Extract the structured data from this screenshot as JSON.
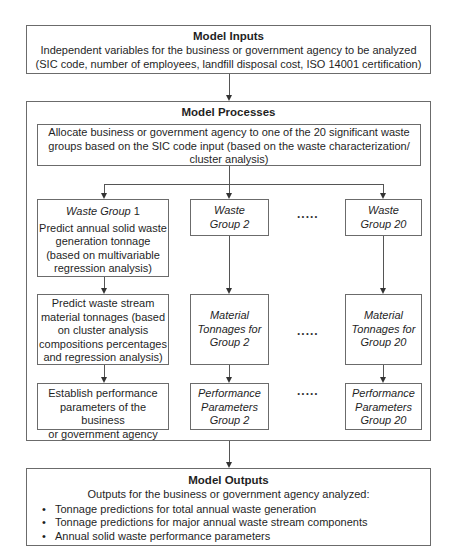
{
  "inputs": {
    "title": "Model Inputs",
    "line1": "Independent variables for the business or government agency to be analyzed",
    "line2": "(SIC code, number of employees, landfill disposal cost, ISO 14001 certification)"
  },
  "processes": {
    "title": "Model Processes",
    "allocate": {
      "line1": "Allocate business or government agency to one of the 20 significant waste",
      "line2": "groups based on the SIC code input (based on the waste characterization/",
      "line3": "cluster analysis)"
    },
    "ellipsis": ".....",
    "group1": {
      "header_italic": "Waste Group",
      "header_num": " 1",
      "predict_tonnage": [
        "Predict annual solid waste",
        "generation tonnage",
        "(based on multivariable",
        "regression analysis)"
      ],
      "predict_material": [
        "Predict waste stream",
        "material tonnages (based",
        "on cluster analysis",
        "compositions percentages",
        "and regression analysis)"
      ],
      "establish": [
        "Establish performance",
        "parameters of the business",
        "or government agency"
      ]
    },
    "group2": {
      "header": [
        "Waste",
        "Group 2"
      ],
      "material": [
        "Material",
        "Tonnages for",
        "Group 2"
      ],
      "performance": [
        "Performance",
        "Parameters",
        "Group 2"
      ]
    },
    "group20": {
      "header": [
        "Waste",
        "Group 20"
      ],
      "material": [
        "Material",
        "Tonnages for",
        "Group 20"
      ],
      "performance": [
        "Performance",
        "Parameters",
        "Group 20"
      ]
    }
  },
  "outputs": {
    "title": "Model Outputs",
    "intro": "Outputs for the business or government agency analyzed:",
    "items": [
      "Tonnage predictions for total annual waste generation",
      "Tonnage predictions for major annual waste stream components",
      "Annual solid waste performance parameters"
    ]
  }
}
